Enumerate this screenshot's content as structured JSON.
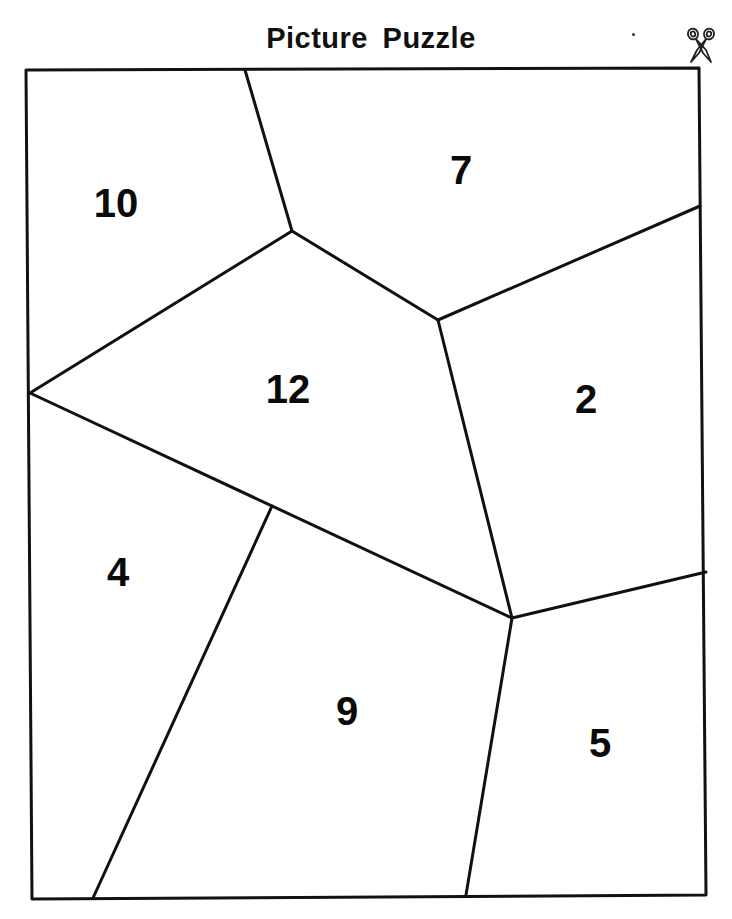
{
  "header": {
    "title": "Picture Puzzle",
    "cut_icon": "scissors-icon"
  },
  "puzzle": {
    "line_color": "#111111",
    "background_color": "#ffffff",
    "pieces": [
      {
        "number": "10",
        "x": 116,
        "y": 203
      },
      {
        "number": "7",
        "x": 461,
        "y": 170
      },
      {
        "number": "12",
        "x": 288,
        "y": 389
      },
      {
        "number": "2",
        "x": 586,
        "y": 399
      },
      {
        "number": "4",
        "x": 118,
        "y": 572
      },
      {
        "number": "9",
        "x": 347,
        "y": 711
      },
      {
        "number": "5",
        "x": 600,
        "y": 743
      }
    ]
  }
}
